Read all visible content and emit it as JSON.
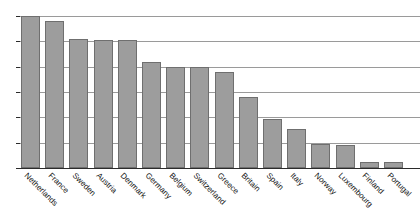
{
  "chart_data": {
    "type": "bar",
    "title": "",
    "xlabel": "",
    "ylabel": "",
    "ylim": [
      0,
      6
    ],
    "yticks": [
      0,
      1,
      2,
      3,
      4,
      5,
      6
    ],
    "grid": true,
    "legend": false,
    "orientation": "vertical",
    "sorted": "descending",
    "categories": [
      "Netherlands",
      "France",
      "Sweden",
      "Austria",
      "Denmark",
      "Germany",
      "Belgium",
      "Switzerland",
      "Greece",
      "Britain",
      "Spain",
      "Italy",
      "Norway",
      "Luxembourg",
      "Finland",
      "Portugal"
    ],
    "values": [
      6.0,
      5.8,
      5.1,
      5.05,
      5.05,
      4.2,
      4.0,
      4.0,
      3.8,
      2.8,
      1.95,
      1.55,
      0.95,
      0.9,
      0.25,
      0.25
    ]
  },
  "style": {
    "bar_fill": "#9d9d9d",
    "bar_stroke": "#6f6f6f",
    "gridline_color": "#9a9a9a",
    "axis_color": "#2b2b2b",
    "background": "#ffffff",
    "text_color": "#111111"
  },
  "top_cropped_text": ""
}
